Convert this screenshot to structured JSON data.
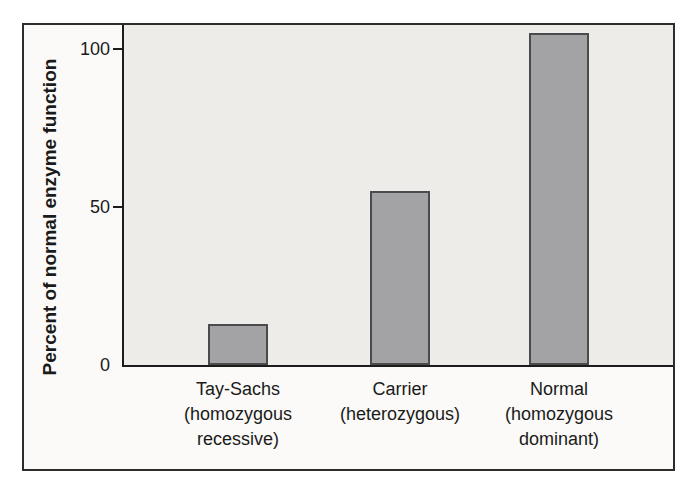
{
  "chart_data": {
    "type": "bar",
    "title": "",
    "ylabel": "Percent of normal enzyme function",
    "xlabel": "",
    "categories": [
      "Tay-Sachs (homozygous recessive)",
      "Carrier (heterozygous)",
      "Normal (homozygous dominant)"
    ],
    "category_lines": [
      [
        "Tay-Sachs",
        "(homozygous",
        "recessive)"
      ],
      [
        "Carrier",
        "(heterozygous)"
      ],
      [
        "Normal",
        "(homozygous",
        "dominant)"
      ]
    ],
    "values": [
      13,
      55,
      105
    ],
    "yticks": [
      0,
      50,
      100
    ],
    "ylim": [
      0,
      107.5
    ],
    "grid": false,
    "legend_position": "none",
    "colors": {
      "bar_fill": "#a3a3a5",
      "bar_border": "#4b4b4d",
      "plot_background": "#edece9",
      "frame_background": "#fbfaf8",
      "frame_border": "#2d2d2d",
      "axis": "#1c1c1c",
      "text": "#1a1a1a",
      "page_background": "#ffffff"
    }
  }
}
